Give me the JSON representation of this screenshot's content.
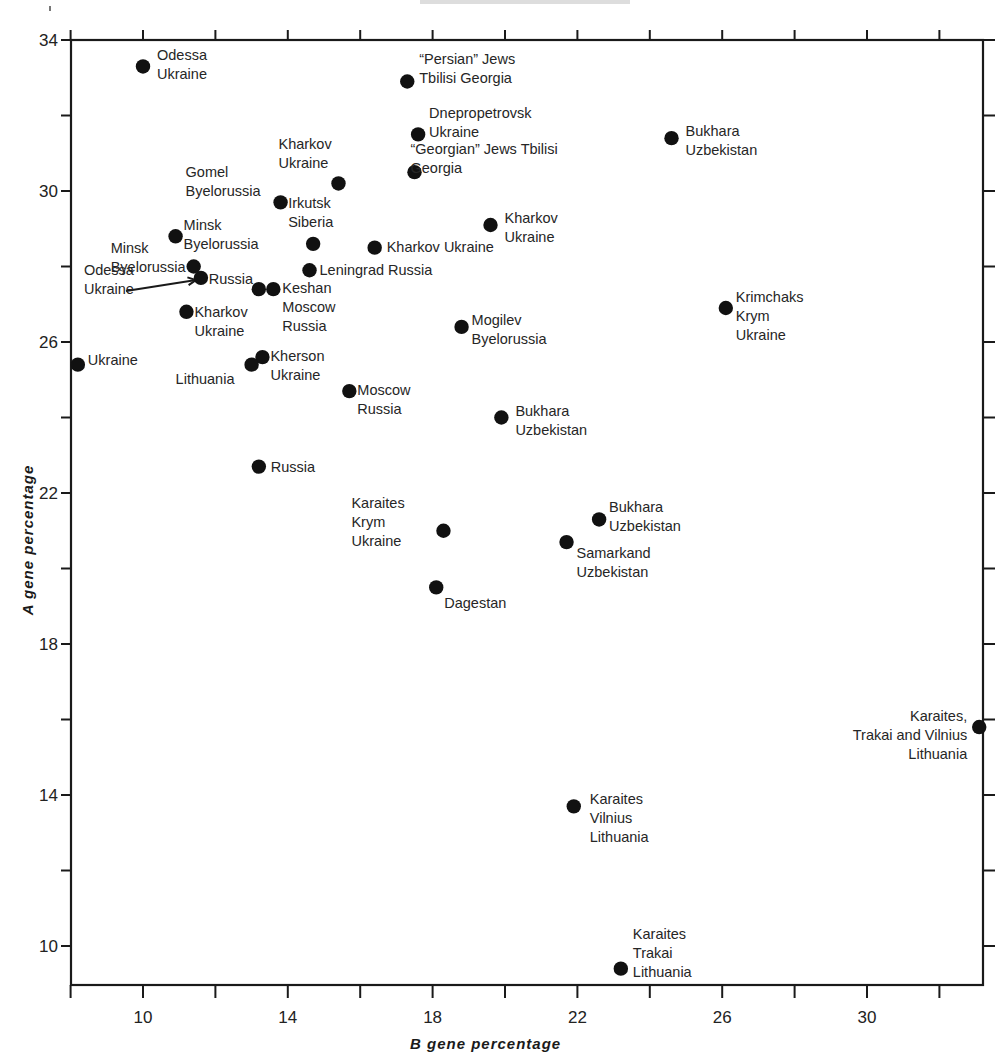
{
  "chart_data": {
    "type": "scatter",
    "title": "",
    "xlabel": "B gene percentage",
    "ylabel": "A gene percentage",
    "xlim": [
      8.0,
      33.3
    ],
    "ylim": [
      9.0,
      34.0
    ],
    "grid": false,
    "legend": null,
    "x_ticks": [
      10,
      14,
      18,
      22,
      26,
      30
    ],
    "x_minor_ticks": [
      8,
      12,
      16,
      20,
      24,
      28,
      32
    ],
    "y_ticks": [
      10,
      14,
      18,
      22,
      26,
      30,
      34
    ],
    "y_minor_ticks": [
      12,
      16,
      20,
      24,
      28,
      32
    ],
    "points": [
      {
        "x": 10.0,
        "y": 33.3,
        "label": [
          "Odessa",
          "Ukraine"
        ]
      },
      {
        "x": 17.3,
        "y": 32.9,
        "label": [
          "“Persian” Jews",
          "Tbilisi  Georgia"
        ]
      },
      {
        "x": 17.6,
        "y": 31.5,
        "label": [
          "Dnepropetrovsk",
          "Ukraine"
        ]
      },
      {
        "x": 24.6,
        "y": 31.4,
        "label": [
          "Bukhara",
          "Uzbekistan"
        ]
      },
      {
        "x": 17.5,
        "y": 30.5,
        "label": [
          "“Georgian” Jews  Tbilisi",
          "Georgia"
        ]
      },
      {
        "x": 15.4,
        "y": 30.2,
        "label": [
          "Kharkov",
          "Ukraine"
        ]
      },
      {
        "x": 13.8,
        "y": 29.7,
        "label": [
          "Gomel",
          "Byelorussia"
        ]
      },
      {
        "x": 19.6,
        "y": 29.1,
        "label": [
          "Kharkov",
          "Ukraine"
        ]
      },
      {
        "x": 10.9,
        "y": 28.8,
        "label": [
          "Minsk",
          "Byelorussia"
        ]
      },
      {
        "x": 14.7,
        "y": 28.6,
        "label": [
          "Irkutsk",
          "Siberia"
        ]
      },
      {
        "x": 16.4,
        "y": 28.5,
        "label": [
          "Kharkov  Ukraine"
        ]
      },
      {
        "x": 11.4,
        "y": 28.0,
        "label": [
          "Minsk",
          "Byelorussia"
        ]
      },
      {
        "x": 11.6,
        "y": 27.7,
        "label": [
          "Odessa",
          "Ukraine"
        ]
      },
      {
        "x": 14.6,
        "y": 27.9,
        "label": [
          "Leningrad  Russia"
        ]
      },
      {
        "x": 13.2,
        "y": 27.4,
        "label": [
          "Russia"
        ]
      },
      {
        "x": 13.6,
        "y": 27.4,
        "label": [
          "Keshan",
          "Moscow",
          "Russia"
        ]
      },
      {
        "x": 11.2,
        "y": 26.8,
        "label": [
          "Kharkov",
          "Ukraine"
        ]
      },
      {
        "x": 26.1,
        "y": 26.9,
        "label": [
          "Krimchaks",
          "Krym",
          "Ukraine"
        ]
      },
      {
        "x": 18.8,
        "y": 26.4,
        "label": [
          "Mogilev",
          "Byelorussia"
        ]
      },
      {
        "x": 8.2,
        "y": 25.4,
        "label": [
          "Ukraine"
        ]
      },
      {
        "x": 13.3,
        "y": 25.6,
        "label": [
          "Kherson",
          "Ukraine"
        ]
      },
      {
        "x": 13.0,
        "y": 25.4,
        "label": [
          "Lithuania"
        ]
      },
      {
        "x": 15.7,
        "y": 24.7,
        "label": [
          "Moscow",
          "Russia"
        ]
      },
      {
        "x": 19.9,
        "y": 24.0,
        "label": [
          "Bukhara",
          "Uzbekistan"
        ]
      },
      {
        "x": 13.2,
        "y": 22.7,
        "label": [
          "Russia"
        ]
      },
      {
        "x": 18.3,
        "y": 21.0,
        "label": [
          "Karaites",
          "Krym",
          "Ukraine"
        ]
      },
      {
        "x": 22.6,
        "y": 21.3,
        "label": [
          "Bukhara",
          "Uzbekistan"
        ]
      },
      {
        "x": 21.7,
        "y": 20.7,
        "label": [
          "Samarkand",
          "Uzbekistan"
        ]
      },
      {
        "x": 18.1,
        "y": 19.5,
        "label": [
          "Dagestan"
        ]
      },
      {
        "x": 33.1,
        "y": 15.8,
        "label": [
          "Karaites,",
          "Trakai and Vilnius",
          "Lithuania"
        ]
      },
      {
        "x": 21.9,
        "y": 13.7,
        "label": [
          "Karaites",
          "Vilnius",
          "Lithuania"
        ]
      },
      {
        "x": 23.2,
        "y": 9.4,
        "label": [
          "Karaites",
          "Trakai",
          "Lithuania"
        ]
      }
    ]
  },
  "layout": {
    "plot": {
      "left": 71,
      "top": 40,
      "right": 983,
      "bottom": 985
    },
    "x_map": {
      "v0": 10,
      "px0": 143,
      "per_unit": 36.2
    },
    "y_map": {
      "v0": 34,
      "px0": 40,
      "per_unit": 37.75
    },
    "label_offsets": [
      [
        14,
        -6,
        "start"
      ],
      [
        12,
        -18,
        "start"
      ],
      [
        11,
        -16,
        "start"
      ],
      [
        14,
        -2,
        "start"
      ],
      [
        -4,
        -18,
        "start"
      ],
      [
        -60,
        -34,
        "start"
      ],
      [
        -95,
        -25,
        "start"
      ],
      [
        14,
        -2,
        "start"
      ],
      [
        8,
        -6,
        "start"
      ],
      [
        -25,
        -36,
        "start"
      ],
      [
        12,
        4,
        "start"
      ],
      [
        -83,
        -14,
        "start"
      ],
      [
        -117,
        -3,
        "start"
      ],
      [
        10,
        5,
        "start"
      ],
      [
        -50,
        -5,
        "start"
      ],
      [
        9,
        4,
        "start"
      ],
      [
        8,
        5,
        "start"
      ],
      [
        10,
        -6,
        "start"
      ],
      [
        10,
        -2,
        "start"
      ],
      [
        10,
        0,
        "start"
      ],
      [
        8,
        4,
        "start"
      ],
      [
        -76,
        19,
        "start"
      ],
      [
        8,
        4,
        "start"
      ],
      [
        14,
        -2,
        "start"
      ],
      [
        12,
        5,
        "start"
      ],
      [
        -92,
        -23,
        "start"
      ],
      [
        10,
        -7,
        "start"
      ],
      [
        10,
        16,
        "start"
      ],
      [
        8,
        21,
        "start"
      ],
      [
        -12,
        -6,
        "end"
      ],
      [
        16,
        -2,
        "start"
      ],
      [
        12,
        -30,
        "start"
      ]
    ],
    "odessa_arrow": {
      "from": [
        126,
        291
      ],
      "to": [
        196,
        280
      ]
    }
  }
}
